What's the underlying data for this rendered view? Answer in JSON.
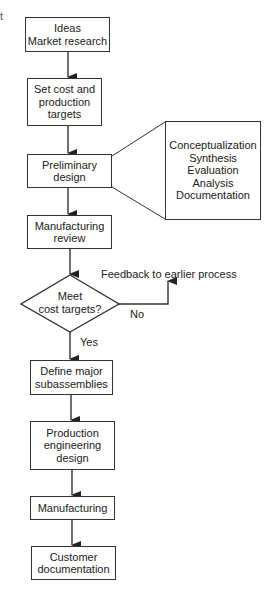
{
  "diagram": {
    "type": "flowchart",
    "stray_mark": "t",
    "nodes": [
      {
        "id": "ideas",
        "lines": [
          "Ideas",
          "Market research"
        ]
      },
      {
        "id": "targets",
        "lines": [
          "Set cost and",
          "production",
          "targets"
        ]
      },
      {
        "id": "preliminary",
        "lines": [
          "Preliminary",
          "design"
        ]
      },
      {
        "id": "mfg_review",
        "lines": [
          "Manufacturing",
          "review"
        ]
      },
      {
        "id": "decision",
        "shape": "diamond",
        "lines": [
          "Meet",
          "cost targets?"
        ]
      },
      {
        "id": "subassemblies",
        "lines": [
          "Define major",
          "subassemblies"
        ]
      },
      {
        "id": "prod_eng",
        "lines": [
          "Production",
          "engineering",
          "design"
        ]
      },
      {
        "id": "manufacturing",
        "lines": [
          "Manufacturing"
        ]
      },
      {
        "id": "customer_doc",
        "lines": [
          "Customer",
          "documentation"
        ]
      }
    ],
    "expansion": {
      "of": "preliminary",
      "lines": [
        "Conceptualization",
        "Synthesis",
        "Evaluation",
        "Analysis",
        "Documentation"
      ]
    },
    "edge_labels": {
      "yes": "Yes",
      "no": "No",
      "feedback": "Feedback to earlier process"
    },
    "colors": {
      "line": "#333333",
      "text": "#222222",
      "background": "#ffffff"
    }
  }
}
